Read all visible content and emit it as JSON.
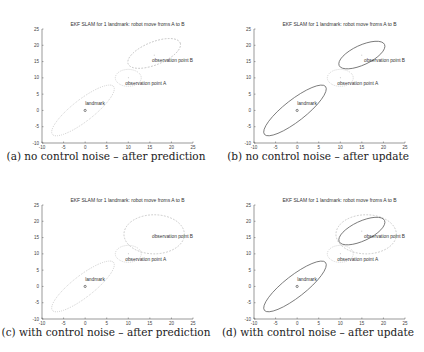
{
  "figure": {
    "panels": [
      {
        "id": "a",
        "caption": "(a) no control noise – after prediction"
      },
      {
        "id": "b",
        "caption": "(b) no control noise – after update"
      },
      {
        "id": "c",
        "caption": "(c) with control noise – after prediction"
      },
      {
        "id": "d",
        "caption": "(d) with control noise – after update"
      }
    ]
  },
  "chart_data": [
    {
      "type": "scatter",
      "panel": "a",
      "title": "EKF SLAM for 1 landmark: robot move froms A to B",
      "caption": "(a) no control noise – after prediction",
      "xlim": [
        -10,
        25
      ],
      "ylim": [
        -10,
        25
      ],
      "xticks": [
        -10,
        -5,
        0,
        5,
        10,
        15,
        20,
        25
      ],
      "yticks": [
        -10,
        -5,
        0,
        5,
        10,
        15,
        20,
        25
      ],
      "grid": false,
      "points": [
        {
          "label": "landmark",
          "x": 0,
          "y": 0
        },
        {
          "label": "observation point A",
          "x": 10,
          "y": 10
        },
        {
          "label": "observation point B",
          "x": 16,
          "y": 17
        }
      ],
      "ellipses": [
        {
          "name": "landmark covariance",
          "cx": -0.5,
          "cy": 0,
          "rx": 9,
          "ry": 3.3,
          "angle": -38,
          "style": "dotted"
        },
        {
          "name": "point A covariance",
          "cx": 10,
          "cy": 10,
          "rx": 3,
          "ry": 2.6,
          "angle": 0,
          "style": "dotted"
        },
        {
          "name": "point B covariance (predicted)",
          "cx": 16,
          "cy": 17.5,
          "rx": 6.5,
          "ry": 3.5,
          "angle": -22,
          "style": "dashed"
        }
      ]
    },
    {
      "type": "scatter",
      "panel": "b",
      "title": "EKF SLAM for 1 landmark: robot move froms A to B",
      "caption": "(b) no control noise – after update",
      "xlim": [
        -10,
        25
      ],
      "ylim": [
        -10,
        25
      ],
      "xticks": [
        -10,
        -5,
        0,
        5,
        10,
        15,
        20,
        25
      ],
      "yticks": [
        -10,
        -5,
        0,
        5,
        10,
        15,
        20,
        25
      ],
      "grid": false,
      "points": [
        {
          "label": "landmark",
          "x": 0,
          "y": 0
        },
        {
          "label": "observation point A",
          "x": 10,
          "y": 10
        },
        {
          "label": "observation point B",
          "x": 15,
          "y": 17
        }
      ],
      "ellipses": [
        {
          "name": "landmark covariance",
          "cx": -0.5,
          "cy": 0,
          "rx": 9,
          "ry": 3.3,
          "angle": -38,
          "style": "solid"
        },
        {
          "name": "point A covariance",
          "cx": 10,
          "cy": 10,
          "rx": 3,
          "ry": 2.6,
          "angle": 0,
          "style": "dotted"
        },
        {
          "name": "point B covariance (updated)",
          "cx": 15,
          "cy": 17,
          "rx": 5.8,
          "ry": 3,
          "angle": -25,
          "style": "solid"
        }
      ]
    },
    {
      "type": "scatter",
      "panel": "c",
      "title": "EKF SLAM for 1 landmark: robot move froms A to B",
      "caption": "(c) with control noise – after prediction",
      "xlim": [
        -10,
        25
      ],
      "ylim": [
        -10,
        25
      ],
      "xticks": [
        -10,
        -5,
        0,
        5,
        10,
        15,
        20,
        25
      ],
      "yticks": [
        -10,
        -5,
        0,
        5,
        10,
        15,
        20,
        25
      ],
      "grid": false,
      "points": [
        {
          "label": "landmark",
          "x": 0,
          "y": 0
        },
        {
          "label": "observation point A",
          "x": 10,
          "y": 10
        },
        {
          "label": "observation point B",
          "x": 16,
          "y": 16
        }
      ],
      "ellipses": [
        {
          "name": "landmark covariance",
          "cx": -0.5,
          "cy": 0,
          "rx": 9,
          "ry": 3.3,
          "angle": -38,
          "style": "dotted"
        },
        {
          "name": "point A covariance",
          "cx": 10,
          "cy": 10,
          "rx": 3,
          "ry": 2.6,
          "angle": 0,
          "style": "dotted"
        },
        {
          "name": "point B covariance (predicted)",
          "cx": 16,
          "cy": 16,
          "rx": 7,
          "ry": 6,
          "angle": 0,
          "style": "dashed"
        }
      ]
    },
    {
      "type": "scatter",
      "panel": "d",
      "title": "EKF SLAM for 1 landmark: robot move froms A to B",
      "caption": "(d) with control noise – after update",
      "xlim": [
        -10,
        25
      ],
      "ylim": [
        -10,
        25
      ],
      "xticks": [
        -10,
        -5,
        0,
        5,
        10,
        15,
        20,
        25
      ],
      "yticks": [
        -10,
        -5,
        0,
        5,
        10,
        15,
        20,
        25
      ],
      "grid": false,
      "points": [
        {
          "label": "landmark",
          "x": 0,
          "y": 0
        },
        {
          "label": "observation point A",
          "x": 10,
          "y": 10
        },
        {
          "label": "observation point B",
          "x": 15,
          "y": 17
        }
      ],
      "ellipses": [
        {
          "name": "landmark covariance",
          "cx": -0.5,
          "cy": 0,
          "rx": 9,
          "ry": 3.3,
          "angle": -38,
          "style": "solid"
        },
        {
          "name": "point A covariance",
          "cx": 10,
          "cy": 10,
          "rx": 3,
          "ry": 2.6,
          "angle": 0,
          "style": "dotted"
        },
        {
          "name": "point B covariance (predicted)",
          "cx": 16,
          "cy": 16,
          "rx": 7,
          "ry": 6,
          "angle": 0,
          "style": "dashed"
        },
        {
          "name": "point B covariance (updated)",
          "cx": 15,
          "cy": 17,
          "rx": 5.8,
          "ry": 3,
          "angle": -25,
          "style": "solid"
        }
      ]
    }
  ]
}
